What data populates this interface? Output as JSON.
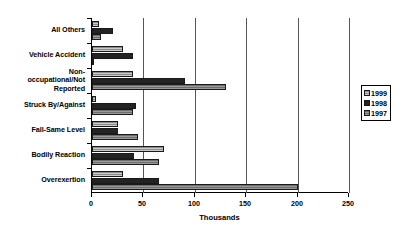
{
  "chart_data": {
    "type": "bar",
    "orientation": "horizontal",
    "title": "",
    "xlabel": "Thousands",
    "ylabel": "",
    "xlim": [
      0,
      250
    ],
    "xticks": [
      0,
      50,
      100,
      150,
      200,
      250
    ],
    "grid": true,
    "legend_position": "right",
    "categories": [
      "All Others",
      "Vehicle Accident",
      "Non-occupational/Not Reported",
      "Struck By/Against",
      "Fall-Same Level",
      "Bodily Reaction",
      "Overexertion"
    ],
    "series": [
      {
        "name": "1999",
        "values": [
          7,
          30,
          40,
          4,
          25,
          70,
          30
        ]
      },
      {
        "name": "1998",
        "values": [
          20,
          40,
          90,
          43,
          25,
          41,
          65
        ]
      },
      {
        "name": "1997",
        "values": [
          9,
          2,
          130,
          40,
          45,
          65,
          200
        ]
      }
    ]
  },
  "category_labels": [
    {
      "line1": "All Others",
      "line2": "",
      "line3": ""
    },
    {
      "line1": "Vehicle Accident",
      "line2": "",
      "line3": ""
    },
    {
      "line1": "Non-",
      "line2": "occupational/Not",
      "line3": "Reported"
    },
    {
      "line1": "Struck By/Against",
      "line2": "",
      "line3": ""
    },
    {
      "line1": "Fall-Same Level",
      "line2": "",
      "line3": ""
    },
    {
      "line1": "Bodily Reaction",
      "line2": "",
      "line3": ""
    },
    {
      "line1": "Overexertion",
      "line2": "",
      "line3": ""
    }
  ],
  "axis": {
    "title": "Thousands",
    "tick_labels": [
      "0",
      "50",
      "100",
      "150",
      "200",
      "250"
    ]
  },
  "legend": {
    "entries": [
      {
        "label": "1999"
      },
      {
        "label": "1998"
      },
      {
        "label": "1997"
      }
    ]
  },
  "colors": {
    "series_1999": "#8c8c8c",
    "series_1998": "#232323",
    "series_1997": "#6e6e6e",
    "axis": "#000000",
    "gridline": "#555555",
    "background": "#ffffff"
  }
}
